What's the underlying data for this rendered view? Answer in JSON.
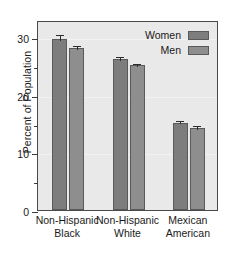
{
  "chart_data": {
    "type": "bar",
    "title": "",
    "subtitle": "",
    "xlabel": "",
    "ylabel": "Percent of Population",
    "categories": [
      "Non-Hispanic Black",
      "Non-Hispanic White",
      "Mexican American"
    ],
    "category_lines": [
      [
        "Non-Hispanic",
        "Black"
      ],
      [
        "Non-Hispanic",
        "White"
      ],
      [
        "Mexican",
        "American"
      ]
    ],
    "series": [
      {
        "name": "Women",
        "color": "#7d7d7d",
        "values": [
          29.7,
          26.3,
          15.2
        ],
        "errors": [
          1.0,
          0.7,
          0.6
        ]
      },
      {
        "name": "Men",
        "color": "#8e8e8e",
        "values": [
          28.1,
          25.2,
          14.3
        ],
        "errors": [
          0.7,
          0.5,
          0.6
        ]
      }
    ],
    "ylim": [
      0,
      33
    ],
    "ytick_labels": [
      "0",
      "10",
      "20",
      "30"
    ],
    "ytick_values": [
      0,
      10,
      20,
      30
    ],
    "yminor_tick_values": [
      5,
      15,
      25
    ],
    "grid": true,
    "legend_position": "top-right",
    "plot_background": "#e9e9e9",
    "axis_color": "#4a4a4a"
  },
  "legend": {
    "entries": [
      {
        "label": "Women"
      },
      {
        "label": "Men"
      }
    ]
  }
}
